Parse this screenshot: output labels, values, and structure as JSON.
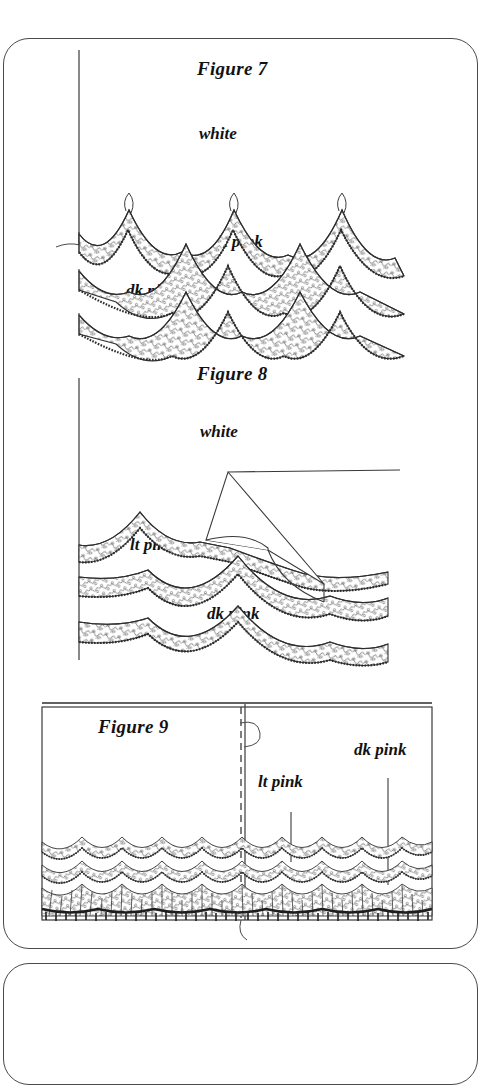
{
  "document": {
    "type": "instruction-illustration-page",
    "background_color": "#ffffff",
    "ink_color": "#1a1a1a",
    "panel_border_color": "#4a4a4a"
  },
  "figures": [
    {
      "id": "figure-7",
      "title": "Figure 7",
      "description": "Three rows of scalloped lace trim layered on a fabric edge with a vertical guide line at the left and small thread loops at the scallop peaks.",
      "labels": [
        {
          "name": "white",
          "text": "white"
        },
        {
          "name": "lt-pink",
          "text": "lt pink"
        },
        {
          "name": "dk-pink",
          "text": "dk pink"
        }
      ],
      "lace_rows": [
        {
          "color_name": "white",
          "scallops": 3
        },
        {
          "color_name": "lt pink",
          "scallops": 3
        },
        {
          "color_name": "dk pink",
          "scallops": 3
        }
      ]
    },
    {
      "id": "figure-8",
      "title": "Figure 8",
      "description": "Same three layered lace rows shown with the white top fabric folded back diagonally to reveal the lt pink and dk pink lace beneath.",
      "labels": [
        {
          "name": "white",
          "text": "white"
        },
        {
          "name": "lt-pink",
          "text": "lt pink"
        },
        {
          "name": "dk-pink",
          "text": "dk pink"
        }
      ],
      "lace_rows": [
        {
          "color_name": "white",
          "scallops": 2
        },
        {
          "color_name": "lt pink",
          "scallops": 2
        },
        {
          "color_name": "dk pink",
          "scallops": 2
        }
      ],
      "fold_flap": {
        "name": "folded-back-white-flap",
        "shape": "parallelogram"
      }
    },
    {
      "id": "figure-9",
      "title": "Figure 9",
      "description": "Finished panel: a rectangular piece of fabric with a centre seam (dashed basting line) and three rows of lace trim along the lower edge, the bottom row gathered into a dense ruffle.",
      "labels": [
        {
          "name": "lt-pink",
          "text": "lt pink"
        },
        {
          "name": "dk-pink",
          "text": "dk pink"
        }
      ],
      "lace_rows": [
        {
          "color_name": "white",
          "style": "scallop"
        },
        {
          "color_name": "lt pink",
          "style": "scallop"
        },
        {
          "color_name": "dk pink",
          "style": "gathered-ruffle"
        }
      ],
      "seam": {
        "name": "centre-seam",
        "style": "dashed"
      }
    }
  ]
}
